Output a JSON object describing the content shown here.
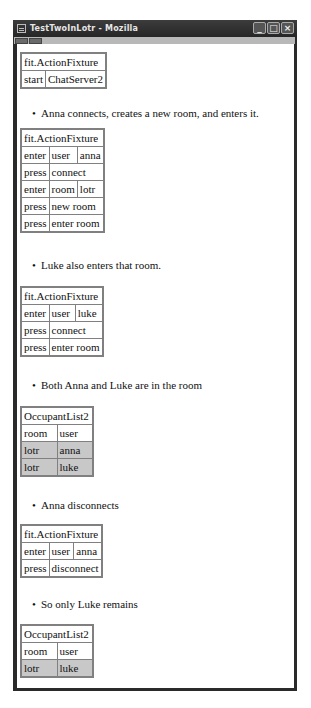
{
  "window": {
    "title": "TestTwoInLotr - Mozilla",
    "buttons": [
      "minimize",
      "maximize",
      "close"
    ],
    "button_glyphs": {
      "minimize": "_",
      "maximize": "□",
      "close": "×"
    }
  },
  "sections": [
    {
      "type": "table",
      "rows": [
        [
          "fit.ActionFixture"
        ],
        [
          "start",
          "ChatServer2"
        ]
      ]
    },
    {
      "type": "bullet",
      "text": "Anna connects, creates a new room, and enters it."
    },
    {
      "type": "table",
      "rows": [
        [
          "fit.ActionFixture"
        ],
        [
          "enter",
          "user",
          "anna"
        ],
        [
          "press",
          "connect"
        ],
        [
          "enter",
          "room",
          "lotr"
        ],
        [
          "press",
          "new room"
        ],
        [
          "press",
          "enter room"
        ]
      ]
    },
    {
      "type": "bullet",
      "text": "Luke also enters that room."
    },
    {
      "type": "table",
      "rows": [
        [
          "fit.ActionFixture"
        ],
        [
          "enter",
          "user",
          "luke"
        ],
        [
          "press",
          "connect"
        ],
        [
          "press",
          "enter room"
        ]
      ]
    },
    {
      "type": "bullet",
      "text": "Both Anna and Luke are in the room"
    },
    {
      "type": "table",
      "rows": [
        [
          "OccupantList2"
        ],
        [
          "room",
          "user"
        ],
        [
          "lotr",
          "anna"
        ],
        [
          "lotr",
          "luke"
        ]
      ],
      "grey_rows": [
        2,
        3
      ]
    },
    {
      "type": "bullet",
      "text": "Anna disconnects"
    },
    {
      "type": "table",
      "rows": [
        [
          "fit.ActionFixture"
        ],
        [
          "enter",
          "user",
          "anna"
        ],
        [
          "press",
          "disconnect"
        ]
      ]
    },
    {
      "type": "bullet",
      "text": "So only Luke remains"
    },
    {
      "type": "table",
      "rows": [
        [
          "OccupantList2"
        ],
        [
          "room",
          "user"
        ],
        [
          "lotr",
          "luke"
        ]
      ],
      "grey_rows": [
        2
      ]
    }
  ],
  "colors": {
    "titlebar": "#2a2a2a",
    "table_border": "#808080",
    "result_cell": "#c8c8c8"
  }
}
